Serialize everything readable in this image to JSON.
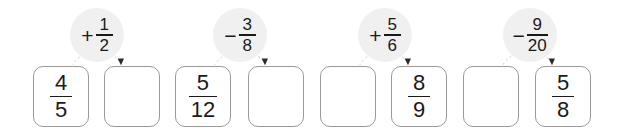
{
  "page": {
    "width": 630,
    "height": 140,
    "background_color": "#ffffff"
  },
  "style": {
    "box_border_color": "#9a9a9a",
    "bubble_fill_color": "#f0f0f0",
    "text_color": "#1a1a1a",
    "connector_color": "#c8c8c8",
    "arrowhead_color": "#2b2b2b"
  },
  "boxes": [
    {
      "id": "box-1",
      "numerator": "4",
      "denominator": "5",
      "blank": false,
      "x": 33,
      "y": 66
    },
    {
      "id": "box-2",
      "numerator": "",
      "denominator": "",
      "blank": true,
      "x": 104,
      "y": 66
    },
    {
      "id": "box-3",
      "numerator": "5",
      "denominator": "12",
      "blank": false,
      "x": 175,
      "y": 66
    },
    {
      "id": "box-4",
      "numerator": "",
      "denominator": "",
      "blank": true,
      "x": 248,
      "y": 66
    },
    {
      "id": "box-5",
      "numerator": "",
      "denominator": "",
      "blank": true,
      "x": 320,
      "y": 66
    },
    {
      "id": "box-6",
      "numerator": "8",
      "denominator": "9",
      "blank": false,
      "x": 391,
      "y": 66
    },
    {
      "id": "box-7",
      "numerator": "",
      "denominator": "",
      "blank": true,
      "x": 463,
      "y": 66
    },
    {
      "id": "box-8",
      "numerator": "5",
      "denominator": "8",
      "blank": false,
      "x": 535,
      "y": 66
    }
  ],
  "operations": [
    {
      "id": "op-1",
      "sign": "+",
      "numerator": "1",
      "denominator": "2",
      "x": 70,
      "y": 8,
      "from_box": "box-1",
      "to_box": "box-2"
    },
    {
      "id": "op-2",
      "sign": "−",
      "numerator": "3",
      "denominator": "8",
      "x": 213,
      "y": 8,
      "from_box": "box-3",
      "to_box": "box-4"
    },
    {
      "id": "op-3",
      "sign": "+",
      "numerator": "5",
      "denominator": "6",
      "x": 358,
      "y": 8,
      "from_box": "box-5",
      "to_box": "box-6"
    },
    {
      "id": "op-4",
      "sign": "−",
      "numerator": "9",
      "denominator": "20",
      "x": 503,
      "y": 8,
      "from_box": "box-7",
      "to_box": "box-8"
    }
  ]
}
